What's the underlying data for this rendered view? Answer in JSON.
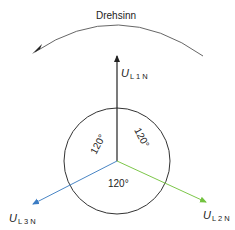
{
  "diagram": {
    "rotation_label": "Drehsinn",
    "phasors": [
      {
        "id": "L1",
        "symbol": "U",
        "subscript": "L 1 N",
        "color": "#222222"
      },
      {
        "id": "L2",
        "symbol": "U",
        "subscript": "L 2 N",
        "color": "#7dc74a"
      },
      {
        "id": "L3",
        "symbol": "U",
        "subscript": "L 3 N",
        "color": "#4a86c5"
      }
    ],
    "angles": [
      {
        "label": "120°",
        "position": "left"
      },
      {
        "label": "120°",
        "position": "right"
      },
      {
        "label": "120°",
        "position": "bottom"
      }
    ]
  }
}
